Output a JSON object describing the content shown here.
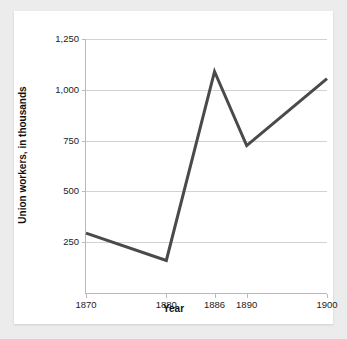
{
  "chart_data": {
    "type": "line",
    "title": "",
    "subtitle": "",
    "xlabel": "Year",
    "ylabel": "Union workers, in thousands",
    "x": [
      1870,
      1880,
      1886,
      1890,
      1900
    ],
    "values": [
      295,
      160,
      1090,
      725,
      1055
    ],
    "series": [
      {
        "name": "Union workers",
        "values": [
          295,
          160,
          1090,
          725,
          1055
        ]
      }
    ],
    "xtick_labels": [
      "1870",
      "1880",
      "1886",
      "1890",
      "1900"
    ],
    "xticks": [
      1870,
      1880,
      1886,
      1890,
      1900
    ],
    "ytick_labels": [
      "250",
      "500",
      "750",
      "1,000",
      "1,250"
    ],
    "yticks": [
      250,
      500,
      750,
      1000,
      1250
    ],
    "xlim": [
      1870,
      1900
    ],
    "ylim": [
      0,
      1250
    ],
    "grid": "horizontal",
    "legend": "none",
    "line_color": "#4a4a4a",
    "grid_color": "#d2d2d2",
    "axis_color": "#b9b9b9",
    "text_color": "#1c1c1c",
    "plot_background": "#ffffff",
    "figure_background": "#ececed"
  },
  "axes": {
    "x_title": "Year",
    "y_title": "Union workers, in thousands"
  }
}
